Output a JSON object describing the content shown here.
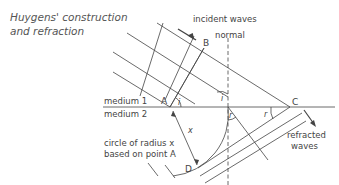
{
  "title": {
    "line1": "Huygens' construction",
    "line2": "and refraction"
  },
  "labels": {
    "incident_waves": "incident waves",
    "normal": "normal",
    "medium1": "medium 1",
    "medium2": "medium 2",
    "circle_line1": "circle of radius x",
    "circle_line2": "based on point A",
    "refracted_line1": "refracted",
    "refracted_line2": "waves"
  },
  "points": {
    "A": "A",
    "B": "B",
    "C": "C",
    "D": "D"
  },
  "angles": {
    "i1": "i",
    "i2": "i",
    "r1": "r",
    "r2": "r"
  },
  "distance": {
    "x": "x"
  },
  "colors": {
    "line": "#444444",
    "text": "#444444"
  }
}
